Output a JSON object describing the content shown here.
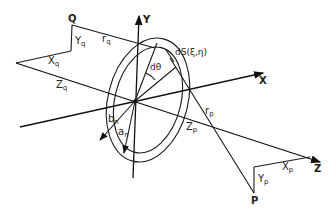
{
  "diagram": {
    "axes": {
      "x_label": "X",
      "y_label": "Y",
      "z_label": "Z"
    },
    "points": {
      "q_label": "Q",
      "p_label": "P"
    },
    "q_components": {
      "y": {
        "main": "Y",
        "sub": "q"
      },
      "x": {
        "main": "X",
        "sub": "q"
      },
      "z": {
        "main": "Z",
        "sub": "q"
      },
      "r": {
        "main": "r",
        "sub": "q"
      }
    },
    "p_components": {
      "y": {
        "main": "Y",
        "sub": "p"
      },
      "x": {
        "main": "X",
        "sub": "p"
      },
      "z": {
        "main": "Z",
        "sub": "p"
      },
      "r": {
        "main": "r",
        "sub": "p"
      }
    },
    "ring": {
      "outer_radius": {
        "main": "b",
        "sub": "n"
      },
      "inner_radius": {
        "main": "a",
        "sub": "n"
      },
      "angle_label": "dθ",
      "element_label": "dS(ξ,η)"
    }
  }
}
